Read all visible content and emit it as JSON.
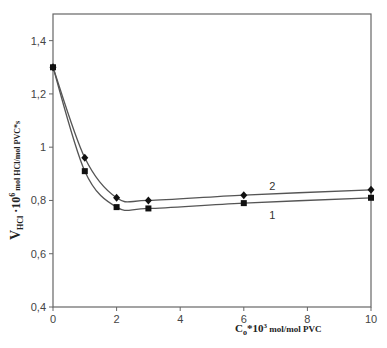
{
  "chart_data": {
    "type": "line",
    "title": "",
    "xlabel": "C_o*10^3 mol/mol PVC",
    "xlabel_parts": {
      "main": "C",
      "sub": "o",
      "mid": "*10",
      "sup": "3",
      "tail": " mol/mol PVC"
    },
    "ylabel": "V_HCl · 10^6 mol HCl/mol PVC*s",
    "ylabel_parts": {
      "main": "V",
      "sub": "HCl",
      "mid": " ·10",
      "sup": "6",
      "tail": " mol HCl/mol PVC*s"
    },
    "xlim": [
      0,
      10
    ],
    "ylim": [
      0.4,
      1.5
    ],
    "x_ticks": [
      "0",
      "2",
      "4",
      "6",
      "8",
      "10"
    ],
    "y_ticks": [
      "0,4",
      "0,6",
      "0,8",
      "1",
      "1,2",
      "1,4"
    ],
    "grid": false,
    "legend": "none (inline curve labels)",
    "series": [
      {
        "name": "1",
        "marker": "square",
        "x": [
          0,
          1,
          2,
          3,
          6,
          10
        ],
        "values": [
          1.3,
          0.91,
          0.775,
          0.77,
          0.79,
          0.81
        ]
      },
      {
        "name": "2",
        "marker": "diamond",
        "x": [
          0,
          1,
          2,
          3,
          6,
          10
        ],
        "values": [
          1.3,
          0.96,
          0.81,
          0.8,
          0.82,
          0.84
        ]
      }
    ],
    "annotations": [
      {
        "text": "1",
        "x": 6.9,
        "y": 0.745
      },
      {
        "text": "2",
        "x": 6.9,
        "y": 0.855
      }
    ]
  },
  "colors": {
    "line": "#555555",
    "marker": "#111111",
    "axis": "#666666",
    "text": "#444444"
  }
}
